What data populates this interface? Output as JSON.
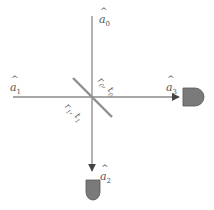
{
  "diagram": {
    "type": "beam-splitter",
    "colors": {
      "beam": "#8a8a8a",
      "splitter": "#8f8f8f",
      "detector_fill": "#7a7a7a",
      "detector_stroke": "#555555",
      "label": "#555555"
    },
    "modes": [
      {
        "id": "a0",
        "symbol": "a",
        "hat": "^",
        "sub": "0",
        "position": "top-input"
      },
      {
        "id": "a1",
        "symbol": "a",
        "hat": "^",
        "sub": "1",
        "position": "left-input"
      },
      {
        "id": "a2",
        "symbol": "a",
        "hat": "^",
        "sub": "2",
        "position": "bottom-output"
      },
      {
        "id": "a3",
        "symbol": "a",
        "hat": "^",
        "sub": "3",
        "position": "right-output"
      }
    ],
    "splitter_labels": [
      {
        "id": "r0t0",
        "r": "r",
        "t": "t",
        "sub": "0",
        "sep": ", "
      },
      {
        "id": "r1t1",
        "r": "r",
        "t": "t",
        "sub": "1",
        "sep": ", "
      }
    ],
    "detectors": [
      {
        "id": "detector-right",
        "output": "a3"
      },
      {
        "id": "detector-bottom",
        "output": "a2"
      }
    ]
  }
}
